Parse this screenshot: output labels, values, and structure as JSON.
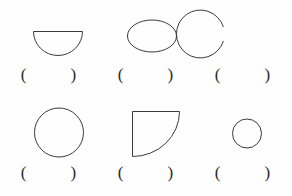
{
  "page": {
    "background_color": "#fefefe",
    "stroke_color": "#3a3a3a",
    "stroke_width": 1,
    "columns": 3,
    "rows": 2
  },
  "answer_marks": {
    "open_paren": "(",
    "close_paren": ")",
    "blank_value": ""
  },
  "items": [
    {
      "index": 1,
      "name": "semicircle",
      "label": "half-disc with flat edge on top",
      "shape_type": "semicircle",
      "orientation": "flat-side-up",
      "answer": ""
    },
    {
      "index": 2,
      "name": "ellipse",
      "label": "horizontal oval",
      "shape_type": "ellipse",
      "orientation": "horizontal",
      "answer": ""
    },
    {
      "index": 3,
      "name": "open-circle",
      "label": "circle with gap on left side",
      "shape_type": "arc",
      "orientation": "gap-left",
      "answer": ""
    },
    {
      "index": 4,
      "name": "circle-large",
      "label": "large circle",
      "shape_type": "circle",
      "orientation": "none",
      "answer": ""
    },
    {
      "index": 5,
      "name": "quarter-disc",
      "label": "quarter disc with concave arc",
      "shape_type": "quarter-disc",
      "orientation": "corner-top-left",
      "answer": ""
    },
    {
      "index": 6,
      "name": "circle-small",
      "label": "small circle",
      "shape_type": "circle",
      "orientation": "none",
      "answer": ""
    }
  ]
}
